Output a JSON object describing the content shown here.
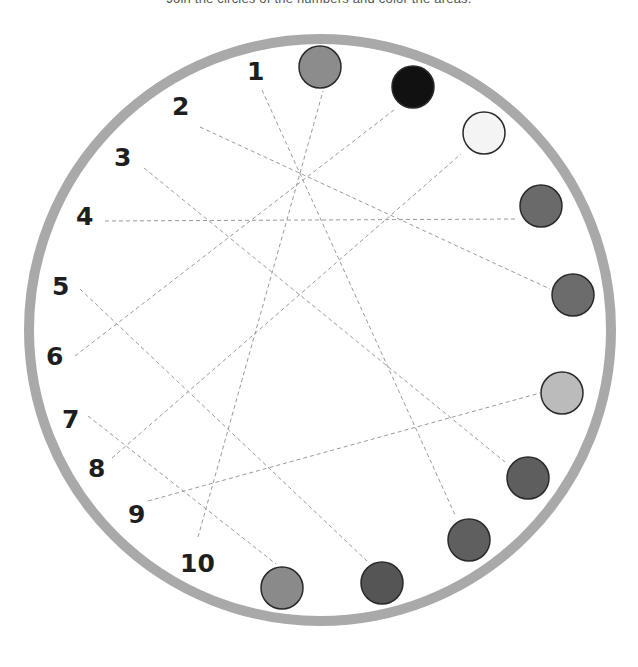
{
  "worksheet": {
    "instruction": "Join the circles of the numbers and color the areas."
  },
  "ring": {
    "cx": 320,
    "cy": 330,
    "r": 291,
    "color": "#a9a9a9"
  },
  "numbers": [
    {
      "label": "1",
      "x": 247,
      "y": 80
    },
    {
      "label": "2",
      "x": 172,
      "y": 115
    },
    {
      "label": "3",
      "x": 114,
      "y": 166
    },
    {
      "label": "4",
      "x": 76,
      "y": 225
    },
    {
      "label": "5",
      "x": 52,
      "y": 295
    },
    {
      "label": "6",
      "x": 46,
      "y": 365
    },
    {
      "label": "7",
      "x": 62,
      "y": 428
    },
    {
      "label": "8",
      "x": 88,
      "y": 477
    },
    {
      "label": "9",
      "x": 128,
      "y": 523
    },
    {
      "label": "10",
      "x": 180,
      "y": 572
    }
  ],
  "circles": [
    {
      "id": "c1",
      "cx": 320,
      "cy": 67,
      "r": 21,
      "fill": "#8c8c8c"
    },
    {
      "id": "c2",
      "cx": 413,
      "cy": 87,
      "r": 21,
      "fill": "#111111"
    },
    {
      "id": "c3",
      "cx": 484,
      "cy": 133,
      "r": 21,
      "fill": "#f4f4f4"
    },
    {
      "id": "c4",
      "cx": 541,
      "cy": 206,
      "r": 21,
      "fill": "#6a6a6a"
    },
    {
      "id": "c5",
      "cx": 573,
      "cy": 295,
      "r": 21,
      "fill": "#6c6c6c"
    },
    {
      "id": "c6",
      "cx": 562,
      "cy": 393,
      "r": 21,
      "fill": "#bbbbbb"
    },
    {
      "id": "c7",
      "cx": 528,
      "cy": 478,
      "r": 21,
      "fill": "#5e5e5e"
    },
    {
      "id": "c8",
      "cx": 469,
      "cy": 540,
      "r": 21,
      "fill": "#5f5f5f"
    },
    {
      "id": "c9",
      "cx": 382,
      "cy": 583,
      "r": 21,
      "fill": "#555555"
    },
    {
      "id": "c10",
      "cx": 282,
      "cy": 588,
      "r": 21,
      "fill": "#8a8a8a"
    }
  ],
  "guides": [
    {
      "from": "1",
      "x1": 262,
      "y1": 90,
      "x2": 456,
      "y2": 517
    },
    {
      "from": "2",
      "x1": 200,
      "y1": 127,
      "x2": 550,
      "y2": 289
    },
    {
      "from": "3",
      "x1": 144,
      "y1": 168,
      "x2": 505,
      "y2": 462
    },
    {
      "from": "4",
      "x1": 105,
      "y1": 221,
      "x2": 517,
      "y2": 219
    },
    {
      "from": "5",
      "x1": 80,
      "y1": 289,
      "x2": 367,
      "y2": 561
    },
    {
      "from": "6",
      "x1": 75,
      "y1": 356,
      "x2": 394,
      "y2": 110
    },
    {
      "from": "7",
      "x1": 88,
      "y1": 416,
      "x2": 276,
      "y2": 564
    },
    {
      "from": "8",
      "x1": 112,
      "y1": 458,
      "x2": 461,
      "y2": 154
    },
    {
      "from": "9",
      "x1": 148,
      "y1": 501,
      "x2": 540,
      "y2": 393
    },
    {
      "from": "10",
      "x1": 198,
      "y1": 537,
      "x2": 323,
      "y2": 91
    }
  ]
}
